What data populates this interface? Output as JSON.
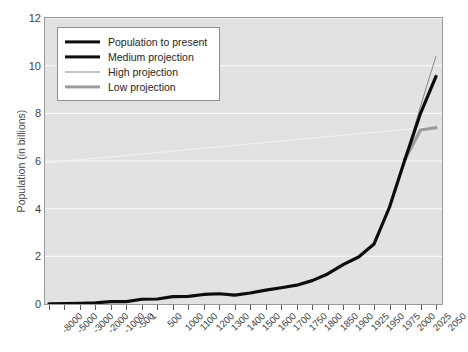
{
  "chart_data": {
    "type": "line",
    "title": "",
    "xlabel": "",
    "ylabel": "Population (in billions)",
    "ylim": [
      0,
      12
    ],
    "yticks": [
      0,
      2,
      4,
      6,
      8,
      10,
      12
    ],
    "grid": "horizontal-white",
    "legend_position": "upper-left-inside",
    "categories": [
      "-8000",
      "-5000",
      "-3000",
      "-2000",
      "-1000",
      "-500",
      "1",
      "500",
      "1000",
      "1100",
      "1200",
      "1300",
      "1400",
      "1500",
      "1600",
      "1700",
      "1750",
      "1800",
      "1850",
      "1900",
      "1925",
      "1950",
      "1975",
      "2000",
      "2025",
      "2050"
    ],
    "series": [
      {
        "name": "Population to present",
        "color": "#0d0d0d",
        "width": 3.2,
        "values": [
          0.005,
          0.02,
          0.03,
          0.05,
          0.1,
          0.1,
          0.2,
          0.21,
          0.31,
          0.32,
          0.4,
          0.43,
          0.37,
          0.46,
          0.58,
          0.68,
          0.79,
          0.98,
          1.26,
          1.65,
          1.97,
          2.52,
          4.07,
          6.07,
          null,
          null
        ]
      },
      {
        "name": "Medium projection",
        "color": "#0d0d0d",
        "width": 3.2,
        "values": [
          null,
          null,
          null,
          null,
          null,
          null,
          null,
          null,
          null,
          null,
          null,
          null,
          null,
          null,
          null,
          null,
          null,
          null,
          null,
          null,
          null,
          null,
          null,
          6.07,
          8.0,
          9.55
        ]
      },
      {
        "name": "High projection",
        "color": "#8a8a8a",
        "width": 1.0,
        "values": [
          null,
          null,
          null,
          null,
          null,
          null,
          null,
          null,
          null,
          null,
          null,
          null,
          null,
          null,
          null,
          null,
          null,
          null,
          null,
          null,
          null,
          null,
          null,
          6.07,
          8.3,
          10.4
        ]
      },
      {
        "name": "Low projection",
        "color": "#9c9c9c",
        "width": 3.2,
        "values": [
          null,
          null,
          null,
          null,
          null,
          null,
          null,
          null,
          null,
          null,
          null,
          null,
          null,
          null,
          null,
          null,
          null,
          null,
          null,
          null,
          null,
          null,
          null,
          6.07,
          7.3,
          7.4
        ]
      }
    ]
  },
  "axes": {
    "ylabel": "Population (in billions)",
    "ytick_labels": [
      "0",
      "2",
      "4",
      "6",
      "8",
      "10",
      "12"
    ],
    "xtick_labels": [
      "-8000",
      "-5000",
      "-3000",
      "-2000",
      "-1000",
      "-500",
      "1",
      "500",
      "1000",
      "1100",
      "1200",
      "1300",
      "1400",
      "1500",
      "1600",
      "1700",
      "1750",
      "1800",
      "1850",
      "1900",
      "1925",
      "1950",
      "1975",
      "2000",
      "2025",
      "2050"
    ]
  },
  "legend": {
    "entries": [
      {
        "label": "Population to present",
        "style": "sw-pop"
      },
      {
        "label": "Medium projection",
        "style": "sw-medium"
      },
      {
        "label": "High projection",
        "style": "sw-high"
      },
      {
        "label": "Low projection",
        "style": "sw-low"
      }
    ]
  },
  "colors": {
    "plot_background": "#e2e2e2",
    "gridline": "#f7f7f7",
    "axis_border": "#9a9a9a",
    "primary_line": "#0d0d0d",
    "high_line": "#8a8a8a",
    "low_line": "#9c9c9c",
    "tick_text": "#3f3f3f"
  }
}
